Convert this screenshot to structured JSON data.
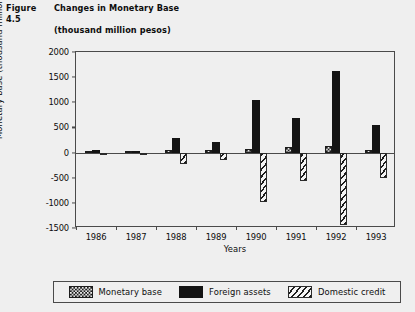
{
  "figure": {
    "number": "Figure 4.5",
    "title": "Changes in Monetary Base",
    "subtitle": "(thousand million pesos)"
  },
  "legend": {
    "items": [
      {
        "label": "Monetary base",
        "pattern": "checkered"
      },
      {
        "label": "Foreign assets",
        "pattern": "solid-black"
      },
      {
        "label": "Domestic credit",
        "pattern": "diagonal-hatch"
      }
    ]
  },
  "chart_data": {
    "type": "bar",
    "title": "Changes in Monetary Base",
    "subtitle": "(thousand million pesos)",
    "xlabel": "Years",
    "ylabel": "Monetary base (thousand million pesos)",
    "categories": [
      "1986",
      "1987",
      "1988",
      "1989",
      "1990",
      "1991",
      "1992",
      "1993"
    ],
    "ylim": [
      -1500,
      2000
    ],
    "yticks": [
      2000,
      1500,
      1000,
      500,
      0,
      -500,
      -1000,
      -1500
    ],
    "ytick_labels": [
      "2000",
      "1500",
      "1000",
      "500",
      "0",
      "-500",
      "-1000",
      "-1500"
    ],
    "grid": false,
    "legend_position": "below",
    "series": [
      {
        "name": "Monetary base",
        "pattern": "checkered",
        "values": [
          40,
          25,
          60,
          55,
          70,
          120,
          130,
          60
        ]
      },
      {
        "name": "Foreign assets",
        "pattern": "solid-black",
        "values": [
          55,
          35,
          285,
          205,
          1055,
          680,
          1620,
          555
        ]
      },
      {
        "name": "Domestic credit",
        "pattern": "diagonal-hatch",
        "values": [
          -20,
          -15,
          -230,
          -150,
          -985,
          -565,
          -1450,
          -500
        ]
      }
    ]
  }
}
